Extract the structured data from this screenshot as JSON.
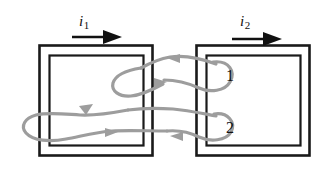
{
  "figure": {
    "type": "circuit-diagram",
    "colors": {
      "core_stroke": "#1a1a1a",
      "winding_wire": "#9d9d9d",
      "current_arrow": "#111111",
      "background": "#ffffff"
    }
  },
  "currents": [
    {
      "symbol": "i",
      "subscript": "1",
      "name": "primary-current",
      "direction": "right"
    },
    {
      "symbol": "i",
      "subscript": "2",
      "name": "secondary-current",
      "direction": "right"
    }
  ],
  "terminals": [
    {
      "label": "1",
      "name": "terminal-1"
    },
    {
      "label": "2",
      "name": "terminal-2"
    }
  ],
  "cores": [
    {
      "name": "left-core",
      "outer": {
        "x": 39,
        "y": 45,
        "width": 113,
        "height": 110
      },
      "inner": {
        "x": 49,
        "y": 55,
        "width": 94,
        "height": 90
      }
    },
    {
      "name": "right-core",
      "outer": {
        "x": 196,
        "y": 45,
        "width": 114,
        "height": 110
      },
      "inner": {
        "x": 206,
        "y": 55,
        "width": 95,
        "height": 90
      }
    }
  ],
  "windings": {
    "count": 2,
    "style": "gray-looping-wire-with-arrowheads",
    "arrow_directions": [
      "left",
      "right",
      "right",
      "left"
    ]
  }
}
